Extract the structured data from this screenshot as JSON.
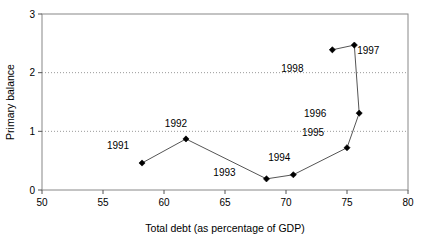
{
  "chart_data": {
    "type": "line",
    "title": "",
    "xlabel": "Total debt (as percentage of GDP)",
    "ylabel": "Primary balance",
    "xlim": [
      50,
      80
    ],
    "ylim": [
      0,
      3
    ],
    "xticks": [
      50,
      55,
      60,
      65,
      70,
      75,
      80
    ],
    "yticks": [
      0,
      1,
      2,
      3
    ],
    "xtick_labels": [
      "50",
      "55",
      "60",
      "65",
      "70",
      "75",
      "80"
    ],
    "ytick_labels": [
      "0",
      "1",
      "2",
      "3"
    ],
    "grid": "horizontal-dotted-at-1-and-2",
    "legend": "none",
    "marker": "diamond",
    "marker_color": "#000000",
    "line_color": "#555555",
    "series": [
      {
        "name": "Primary balance vs total debt",
        "points": [
          {
            "label": "1991",
            "x": 58.2,
            "y": 0.46,
            "label_dx": -24,
            "label_dy": -14
          },
          {
            "label": "1992",
            "x": 61.8,
            "y": 0.87,
            "label_dx": -10,
            "label_dy": -12
          },
          {
            "label": "1993",
            "x": 68.4,
            "y": 0.19,
            "label_dx": -42,
            "label_dy": -3
          },
          {
            "label": "1994",
            "x": 70.6,
            "y": 0.26,
            "label_dx": -14,
            "label_dy": -14
          },
          {
            "label": "1995",
            "x": 75.0,
            "y": 0.72,
            "label_dx": -34,
            "label_dy": -12
          },
          {
            "label": "1996",
            "x": 76.0,
            "y": 1.31,
            "label_dx": -44,
            "label_dy": 4
          },
          {
            "label": "1997",
            "x": 75.6,
            "y": 2.47,
            "label_dx": 14,
            "label_dy": 9
          },
          {
            "label": "1998",
            "x": 73.8,
            "y": 2.39,
            "label_dx": -40,
            "label_dy": 22
          }
        ]
      }
    ]
  }
}
